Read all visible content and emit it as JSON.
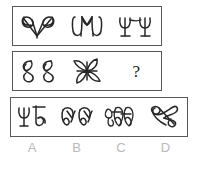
{
  "puzzle": {
    "type": "abstract-reasoning-sequence",
    "question_mark": "?",
    "rows": [
      {
        "id": "row-1",
        "name": "sequence-row-1",
        "cells": [
          {
            "icon": "double-bowtie-v-glyph",
            "label": ""
          },
          {
            "icon": "rounded-m-crown-glyph",
            "label": ""
          },
          {
            "icon": "double-psi-goblet-glyph",
            "label": ""
          }
        ]
      },
      {
        "id": "row-2",
        "name": "sequence-row-2",
        "cells": [
          {
            "icon": "double-figure-eight-glyph",
            "label": ""
          },
          {
            "icon": "four-petal-pinwheel-glyph",
            "label": ""
          },
          {
            "icon": "question-mark",
            "label": "?"
          }
        ]
      },
      {
        "id": "row-3",
        "name": "answer-options-row",
        "cells": [
          {
            "icon": "psi-plus-curl-glyph",
            "label": ""
          },
          {
            "icon": "double-looped-crown-glyph",
            "label": ""
          },
          {
            "icon": "triple-scribble-loop-glyph",
            "label": ""
          },
          {
            "icon": "crossed-double-loop-glyph",
            "label": ""
          }
        ]
      }
    ],
    "option_labels": [
      "A",
      "B",
      "C",
      "D"
    ],
    "colors": {
      "border": "#585858",
      "ink": "#262626",
      "label_text": "#b9b9b9",
      "background": "#ffffff"
    }
  }
}
